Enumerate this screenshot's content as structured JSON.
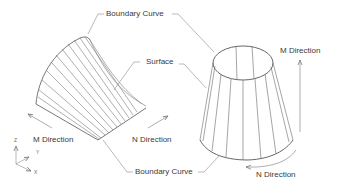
{
  "labels": {
    "boundary_curve_top": "Boundary Curve",
    "boundary_curve_bottom": "Boundary Curve",
    "surface": "Surface",
    "m_direction_left": "M Direction",
    "m_direction_right": "M Direction",
    "n_direction_left": "N Direction",
    "n_direction_right": "N Direction"
  },
  "axes": {
    "z": "Z",
    "y": "Y",
    "x": "X"
  },
  "colors": {
    "line": "#6e6e6e",
    "leader": "#8a8a8a",
    "text": "#3a3a3a"
  }
}
